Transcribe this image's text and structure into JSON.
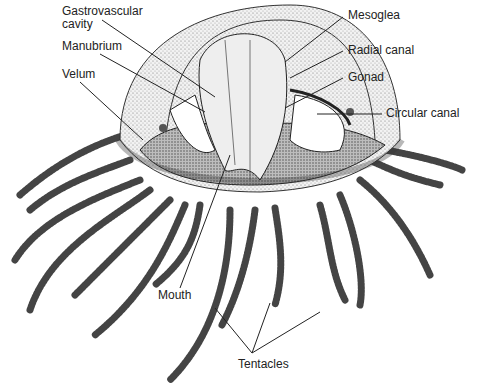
{
  "labels": {
    "gastrovascular": "Gastrovascular\ncavity",
    "manubrium": "Manubrium",
    "velum": "Velum",
    "mesoglea": "Mesoglea",
    "radial_canal": "Radial canal",
    "gonad": "Gonad",
    "circular_canal": "Circular canal",
    "mouth": "Mouth",
    "tentacles": "Tentacles"
  },
  "colors": {
    "ink": "#222222",
    "stipple": "#8a8a8a",
    "dark": "#3a3a3a",
    "paper": "#ffffff"
  }
}
